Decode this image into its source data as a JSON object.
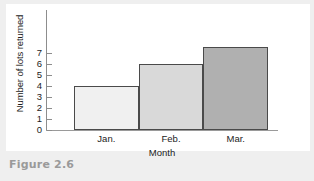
{
  "caption": "Figure 2.6",
  "chart_data": {
    "type": "bar",
    "title": "",
    "xlabel": "Month",
    "ylabel": "Number of lots returned",
    "categories": [
      "Jan.",
      "Feb.",
      "Mar."
    ],
    "values": [
      4,
      6,
      7.5
    ],
    "ylim": [
      0,
      7.7
    ],
    "yticks": [
      0,
      1,
      2,
      3,
      4,
      5,
      6,
      7
    ],
    "ytick_labels": [
      "0",
      "1",
      "2",
      "3",
      "4",
      "5",
      "6",
      "7"
    ],
    "grid": false,
    "legend": null,
    "bar_colors": [
      "#f0f0f0",
      "#d9d9d9",
      "#b0b0b0"
    ],
    "bar_edge_color": "#4a4a4a",
    "axis_color": "#8d8d8d",
    "background": "#ffffff"
  }
}
